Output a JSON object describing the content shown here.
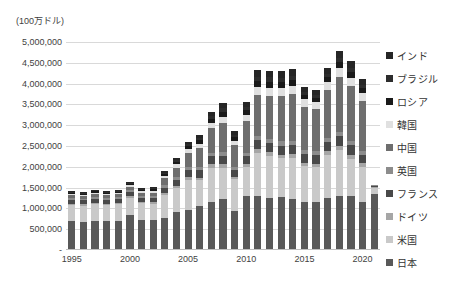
{
  "chart_data": {
    "type": "bar",
    "stacked": true,
    "title": "",
    "axis_unit_label": "(100万ドル)",
    "xlabel": "",
    "ylabel": "",
    "ylim": [
      0,
      5000000
    ],
    "ytick_labels": [
      "5,000,000",
      "4,500,000",
      "4,000,000",
      "3,500,000",
      "3,000,000",
      "2,500,000",
      "2,000,000",
      "1,500,000",
      "1,000,000",
      "500,000",
      "-"
    ],
    "ytick_values": [
      5000000,
      4500000,
      4000000,
      3500000,
      3000000,
      2500000,
      2000000,
      1500000,
      1000000,
      500000,
      0
    ],
    "xtick_labels": [
      "1995",
      "2000",
      "2005",
      "2010",
      "2015",
      "2020"
    ],
    "xtick_categories": [
      "1995",
      "2000",
      "2005",
      "2010",
      "2015",
      "2020"
    ],
    "grid": true,
    "legend_position": "right",
    "categories": [
      "1995",
      "1996",
      "1997",
      "1998",
      "1999",
      "2000",
      "2001",
      "2002",
      "2003",
      "2004",
      "2005",
      "2006",
      "2007",
      "2008",
      "2009",
      "2010",
      "2011",
      "2012",
      "2013",
      "2014",
      "2015",
      "2016",
      "2017",
      "2018",
      "2019",
      "2020",
      "2021"
    ],
    "series": [
      {
        "name": "日本",
        "color": "#595959",
        "values": [
          690000,
          675000,
          705000,
          690000,
          700000,
          840000,
          720000,
          710000,
          775000,
          915000,
          955000,
          1060000,
          1160000,
          1220000,
          930000,
          1295000,
          1310000,
          1260000,
          1265000,
          1220000,
          1160000,
          1155000,
          1245000,
          1300000,
          1290000,
          1150000,
          1350000
        ]
      },
      {
        "name": "米国",
        "color": "#c9c9c9",
        "values": [
          400000,
          395000,
          400000,
          395000,
          395000,
          420000,
          405000,
          400000,
          545000,
          570000,
          740000,
          615000,
          820000,
          760000,
          770000,
          700000,
          1020000,
          1010000,
          940000,
          990000,
          855000,
          830000,
          1035000,
          1100000,
          910000,
          850000,
          145000
        ]
      },
      {
        "name": "ドイツ",
        "color": "#a6a6a6",
        "values": [
          28000,
          30000,
          32000,
          32000,
          33000,
          34000,
          34000,
          36000,
          48000,
          52000,
          60000,
          66000,
          76000,
          82000,
          60000,
          72000,
          88000,
          92000,
          90000,
          94000,
          86000,
          88000,
          94000,
          100000,
          96000,
          88000,
          10000
        ]
      },
      {
        "name": "フランス",
        "color": "#494949",
        "values": [
          95000,
          92000,
          95000,
          95000,
          98000,
          100000,
          96000,
          100000,
          130000,
          145000,
          160000,
          175000,
          195000,
          205000,
          155000,
          185000,
          220000,
          215000,
          215000,
          220000,
          200000,
          205000,
          220000,
          230000,
          225000,
          200000,
          32000
        ]
      },
      {
        "name": "英国",
        "color": "#8c8c8c",
        "values": [
          42000,
          42000,
          44000,
          44000,
          45000,
          47000,
          45000,
          47000,
          62000,
          68000,
          76000,
          84000,
          92000,
          98000,
          74000,
          88000,
          104000,
          102000,
          102000,
          105000,
          96000,
          98000,
          105000,
          110000,
          108000,
          96000,
          15000
        ]
      },
      {
        "name": "中国",
        "color": "#6e6e6e",
        "values": [
          62000,
          64000,
          68000,
          68000,
          72000,
          78000,
          80000,
          90000,
          160000,
          230000,
          340000,
          450000,
          590000,
          700000,
          530000,
          760000,
          980000,
          1020000,
          1090000,
          1120000,
          1050000,
          1010000,
          1140000,
          1320000,
          1310000,
          1200000,
          0
        ]
      },
      {
        "name": "韓国",
        "color": "#e0e0e0",
        "values": [
          36000,
          36000,
          38000,
          30000,
          36000,
          44000,
          42000,
          46000,
          64000,
          80000,
          92000,
          108000,
          126000,
          142000,
          110000,
          150000,
          190000,
          188000,
          190000,
          196000,
          176000,
          172000,
          198000,
          222000,
          208000,
          190000,
          0
        ]
      },
      {
        "name": "ロシア",
        "color": "#1a1a1a",
        "values": [
          22000,
          24000,
          26000,
          22000,
          24000,
          30000,
          30000,
          32000,
          44000,
          56000,
          68000,
          82000,
          100000,
          118000,
          82000,
          110000,
          146000,
          152000,
          150000,
          146000,
          100000,
          96000,
          116000,
          140000,
          134000,
          112000,
          0
        ]
      },
      {
        "name": "ブラジル",
        "color": "#2d2d2d",
        "values": [
          18000,
          18000,
          20000,
          18000,
          18000,
          22000,
          22000,
          22000,
          30000,
          38000,
          48000,
          58000,
          72000,
          86000,
          62000,
          88000,
          110000,
          110000,
          106000,
          102000,
          76000,
          70000,
          84000,
          96000,
          92000,
          80000,
          0
        ]
      },
      {
        "name": "インド",
        "color": "#262626",
        "values": [
          18000,
          18000,
          20000,
          20000,
          20000,
          24000,
          24000,
          26000,
          38000,
          48000,
          62000,
          78000,
          96000,
          116000,
          86000,
          120000,
          158000,
          162000,
          158000,
          154000,
          128000,
          124000,
          148000,
          172000,
          166000,
          140000,
          0
        ]
      }
    ]
  },
  "legend": {
    "items": [
      {
        "label": "インド",
        "color": "#262626"
      },
      {
        "label": "ブラジル",
        "color": "#2d2d2d"
      },
      {
        "label": "ロシア",
        "color": "#1a1a1a"
      },
      {
        "label": "韓国",
        "color": "#e0e0e0"
      },
      {
        "label": "中国",
        "color": "#6e6e6e"
      },
      {
        "label": "英国",
        "color": "#8c8c8c"
      },
      {
        "label": "フランス",
        "color": "#494949"
      },
      {
        "label": "ドイツ",
        "color": "#a6a6a6"
      },
      {
        "label": "米国",
        "color": "#c9c9c9"
      },
      {
        "label": "日本",
        "color": "#595959"
      }
    ]
  },
  "style": {
    "grid_color": "#d9d9d9",
    "axis_color": "#bfbfbf",
    "text_color": "#3f3f3f",
    "background": "#ffffff"
  }
}
